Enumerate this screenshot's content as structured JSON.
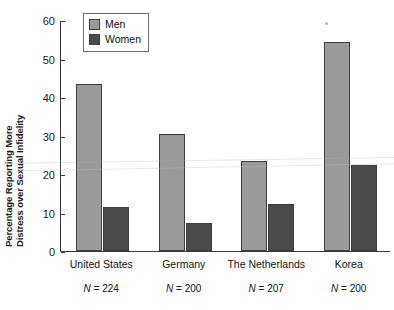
{
  "chart_data": {
    "type": "bar",
    "title": "",
    "xlabel": "",
    "ylabel": "Percentage Reporting More Distress over Sexual Infidelity",
    "ylabel_line1": "Percentage Reporting More",
    "ylabel_line2": "Distress over Sexual Infidelity",
    "ylim": [
      0,
      60
    ],
    "yticks": [
      0,
      10,
      20,
      30,
      40,
      50,
      60
    ],
    "ytick_labels": [
      "0",
      "10",
      "20",
      "30",
      "40",
      "50",
      "60"
    ],
    "grid": false,
    "legend_position": "top-left-inside",
    "categories": [
      "United States",
      "Germany",
      "The Netherlands",
      "Korea"
    ],
    "category_notes": [
      "N = 224",
      "N = 200",
      "N = 207",
      "N = 200"
    ],
    "series": [
      {
        "name": "Men",
        "color": "#9a9a9a",
        "values": [
          43.4,
          30.3,
          23.4,
          54.3
        ]
      },
      {
        "name": "Women",
        "color": "#4a4a4a",
        "values": [
          11.5,
          7.4,
          12.2,
          22.4
        ]
      }
    ]
  },
  "legend": {
    "items": [
      {
        "label": "Men",
        "color": "#9a9a9a"
      },
      {
        "label": "Women",
        "color": "#4a4a4a"
      }
    ]
  },
  "colors": {
    "men": "#9a9a9a",
    "women": "#4a4a4a",
    "axis": "#3a3a3a",
    "bar_outline": "#3d3d3d",
    "background": "#ffffff"
  }
}
